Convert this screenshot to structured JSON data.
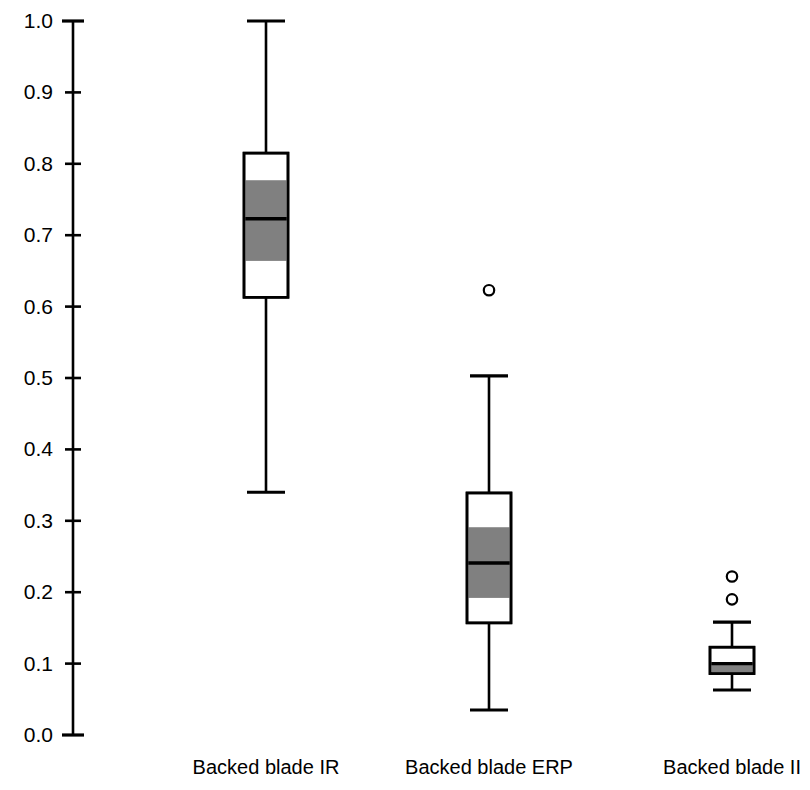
{
  "chart_data": {
    "type": "box",
    "title": "",
    "xlabel": "",
    "ylabel": "",
    "ylim": [
      0.0,
      1.0
    ],
    "grid": false,
    "legend": null,
    "ytick_labels": [
      "1.0",
      "0.9",
      "0.8",
      "0.7",
      "0.6",
      "0.5",
      "0.4",
      "0.3",
      "0.2",
      "0.1",
      "0.0"
    ],
    "ytick_values": [
      1.0,
      0.9,
      0.8,
      0.7,
      0.6,
      0.5,
      0.4,
      0.3,
      0.2,
      0.1,
      0.0
    ],
    "categories": [
      "Backed blade IR",
      "Backed blade ERP",
      "Backed blade II"
    ],
    "boxes": [
      {
        "category": "Backed blade IR",
        "whisker_low": 0.34,
        "q1": 0.613,
        "notch_low": 0.664,
        "median": 0.723,
        "notch_high": 0.777,
        "q3": 0.815,
        "whisker_high": 1.0,
        "outliers": []
      },
      {
        "category": "Backed blade ERP",
        "whisker_low": 0.035,
        "q1": 0.157,
        "notch_low": 0.192,
        "median": 0.241,
        "notch_high": 0.291,
        "q3": 0.339,
        "whisker_high": 0.503,
        "outliers": [
          0.623
        ]
      },
      {
        "category": "Backed blade II",
        "whisker_low": 0.063,
        "q1": 0.086,
        "notch_low": 0.088,
        "median": 0.1,
        "notch_high": 0.101,
        "q3": 0.123,
        "whisker_high": 0.158,
        "outliers": [
          0.222,
          0.19
        ]
      }
    ],
    "colors": {
      "line": "#000000",
      "box_fill": "#ffffff",
      "notch_fill": "#808080",
      "axis": "#000000"
    }
  }
}
